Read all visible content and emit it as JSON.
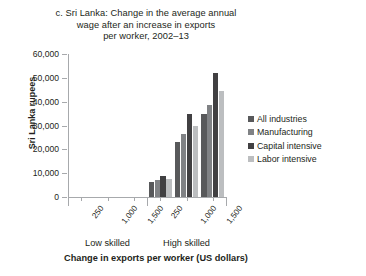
{
  "chart_data": {
    "type": "bar",
    "title": "c. Sri Lanka: Change in the average annual wage after an increase in exports per worker, 2002–13",
    "title_lines": [
      "c. Sri Lanka: Change in the average annual",
      "wage after an increase in exports",
      "per worker, 2002–13"
    ],
    "xlabel": "Change in exports per worker (US dollars)",
    "ylabel": "Sri Lanka rupees",
    "ylim": [
      0,
      60000
    ],
    "ytick_values": [
      0,
      10000,
      20000,
      30000,
      40000,
      50000,
      60000
    ],
    "ytick_labels": [
      "0",
      "10,000",
      "20,000",
      "30,000",
      "40,000",
      "50,000",
      "60,000"
    ],
    "grid": false,
    "legend_position": "right",
    "groups": [
      {
        "label": "Low skilled",
        "categories": [
          "250",
          "1,000",
          "1,500"
        ]
      },
      {
        "label": "High skilled",
        "categories": [
          "250",
          "1,000",
          "1,500"
        ]
      }
    ],
    "categories": [
      "250",
      "1,000",
      "1,500",
      "250",
      "1,000",
      "1,500"
    ],
    "series": [
      {
        "name": "All industries",
        "color": "#58595b",
        "values": [
          0,
          0,
          0,
          6500,
          23000,
          35000
        ]
      },
      {
        "name": "Manufacturing",
        "color": "#808285",
        "values": [
          0,
          0,
          0,
          7000,
          26500,
          38500
        ]
      },
      {
        "name": "Capital intensive",
        "color": "#414042",
        "values": [
          0,
          0,
          0,
          9000,
          35000,
          52000
        ]
      },
      {
        "name": "Labor intensive",
        "color": "#bcbec0",
        "values": [
          0,
          0,
          0,
          7500,
          30000,
          44500
        ]
      }
    ]
  },
  "legend": {
    "items": [
      {
        "label": "All industries",
        "color": "#58595b"
      },
      {
        "label": "Manufacturing",
        "color": "#808285"
      },
      {
        "label": "Capital intensive",
        "color": "#414042"
      },
      {
        "label": "Labor intensive",
        "color": "#bcbec0"
      }
    ]
  }
}
